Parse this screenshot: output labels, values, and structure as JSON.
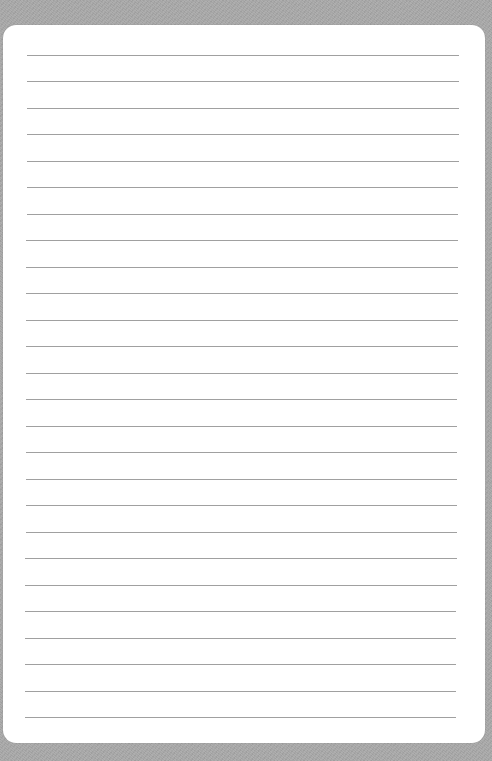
{
  "page": {
    "type": "lined-paper",
    "background_color": "#a9a9a9",
    "sheet_color": "#ffffff",
    "rule_color": "#8f8f8f",
    "rule_count": 26,
    "first_rule_y": 55,
    "rule_spacing": 26.48,
    "rule_left_top": 27,
    "rule_left_bottom": 25,
    "rule_right_top": 459,
    "rule_right_bottom": 456
  }
}
